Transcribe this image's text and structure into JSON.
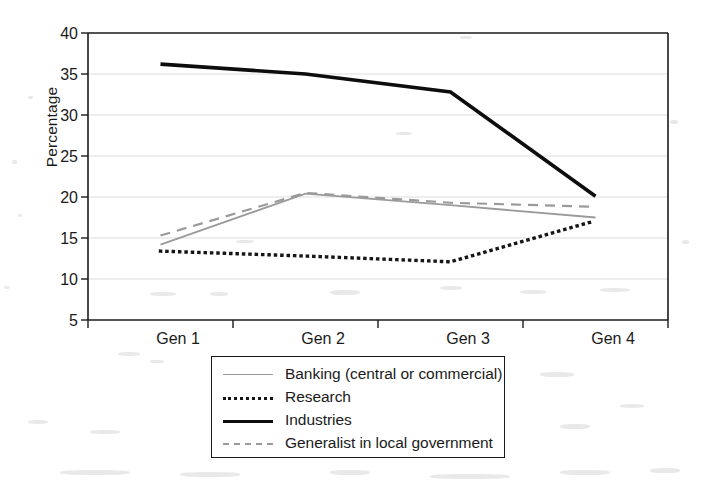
{
  "chart_data": {
    "type": "line",
    "title": "",
    "subtitle": "",
    "xlabel": "",
    "ylabel": "Percentage",
    "categories": [
      "Gen 1",
      "Gen 2",
      "Gen 3",
      "Gen 4"
    ],
    "ylim": [
      5,
      40
    ],
    "ytick_values": [
      40,
      35,
      30,
      25,
      20,
      15,
      10,
      5
    ],
    "ytick_labels": [
      "40",
      "35",
      "30",
      "25",
      "20",
      "15",
      "10",
      "5"
    ],
    "grid": "horizontal",
    "legend_position": "below-plot-center",
    "series": [
      {
        "name": "Banking (central or commercial)",
        "values": [
          14.2,
          20.4,
          19.0,
          17.5
        ],
        "style": "solid",
        "color": "#9a9a9a",
        "width": 1.8
      },
      {
        "name": "Research",
        "values": [
          13.4,
          12.8,
          12.1,
          17.1
        ],
        "style": "dotted",
        "color": "#151515",
        "width": 3.4
      },
      {
        "name": "Industries",
        "values": [
          36.2,
          35.0,
          32.8,
          20.1
        ],
        "style": "solid",
        "color": "#0d0d0d",
        "width": 3.6
      },
      {
        "name": "Generalist in local government",
        "values": [
          15.3,
          20.5,
          19.3,
          18.8
        ],
        "style": "dashed",
        "color": "#9a9a9a",
        "width": 2.2
      }
    ]
  },
  "axes": {
    "y_axis_title": "Percentage",
    "x_tick_labels": [
      "Gen 1",
      "Gen 2",
      "Gen 3",
      "Gen 4"
    ],
    "y_tick_labels": [
      "40",
      "35",
      "30",
      "25",
      "20",
      "15",
      "10",
      "5"
    ]
  },
  "legend": {
    "entries": [
      {
        "label": "Banking (central or commercial)",
        "swatch": "thin-gray-solid-line-icon"
      },
      {
        "label": "Research",
        "swatch": "black-dotted-line-icon"
      },
      {
        "label": "Industries",
        "swatch": "thick-black-solid-line-icon"
      },
      {
        "label": "Generalist in local government",
        "swatch": "gray-dashed-line-icon"
      }
    ]
  },
  "colors": {
    "gray_series": "#9a9a9a",
    "black_series": "#0d0d0d",
    "axis": "#1a1a1a",
    "gridline": "#d9d9d9",
    "background": "#ffffff"
  },
  "plot_geometry": {
    "left": 88,
    "right": 668,
    "top": 33,
    "bottom": 320
  }
}
